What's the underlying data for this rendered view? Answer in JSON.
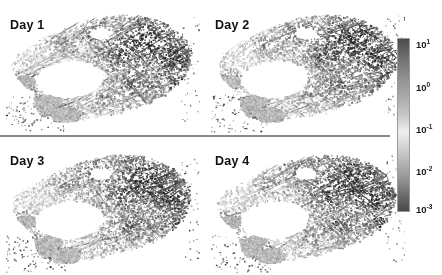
{
  "figure": {
    "width": 442,
    "height": 275,
    "background": "#ffffff",
    "divider_color": "#8a8a8a"
  },
  "panels": [
    {
      "id": "day-1",
      "label": "Day 1"
    },
    {
      "id": "day-2",
      "label": "Day 2"
    },
    {
      "id": "day-3",
      "label": "Day 3"
    },
    {
      "id": "day-4",
      "label": "Day 4"
    }
  ],
  "colorbar": {
    "orientation": "vertical",
    "scale": "log10",
    "colormap": "grayscale",
    "top_color": "#4b4b4b",
    "mid_color": "#efefef",
    "bottom_color": "#4a4a4a",
    "ticks": [
      {
        "base": "10",
        "exp": "1",
        "value": 10,
        "pos_pct": 4
      },
      {
        "base": "10",
        "exp": "0",
        "value": 1,
        "pos_pct": 29
      },
      {
        "base": "10",
        "exp": "-1",
        "value": 0.1,
        "pos_pct": 53
      },
      {
        "base": "10",
        "exp": "-2",
        "value": 0.01,
        "pos_pct": 77
      },
      {
        "base": "10",
        "exp": "-3",
        "value": 0.001,
        "pos_pct": 99
      }
    ]
  },
  "chart_data": {
    "type": "heatmap",
    "title": "",
    "xlabel": "",
    "ylabel": "",
    "grid": false,
    "legend_position": "right",
    "colormap": "grayscale-log",
    "value_range": [
      0.001,
      10
    ],
    "tick_labels": [
      "10^1",
      "10^0",
      "10^-1",
      "10^-2",
      "10^-3"
    ],
    "panel_labels": [
      "Day 1",
      "Day 2",
      "Day 3",
      "Day 4"
    ],
    "layout": "2x2 small-multiples",
    "series": [
      {
        "name": "Day 1",
        "mean": 0.55,
        "max": 10,
        "min": 0.001
      },
      {
        "name": "Day 2",
        "mean": 0.62,
        "max": 10,
        "min": 0.001
      },
      {
        "name": "Day 3",
        "mean": 0.48,
        "max": 10,
        "min": 0.001
      },
      {
        "name": "Day 4",
        "mean": 0.51,
        "max": 10,
        "min": 0.001
      }
    ]
  }
}
